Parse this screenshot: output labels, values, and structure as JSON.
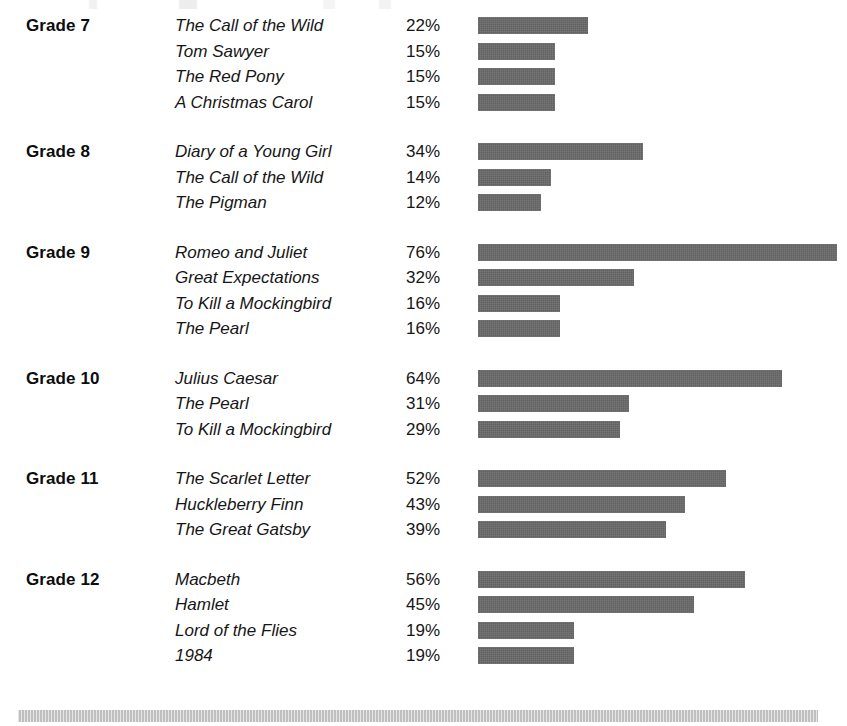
{
  "chart_data": {
    "type": "bar",
    "title": "",
    "subtitle": "",
    "xlabel": "",
    "ylabel": "",
    "orientation": "horizontal",
    "grid": false,
    "legend": null,
    "value_suffix": "%",
    "xlim": [
      0,
      80
    ],
    "bar_color": "#676767",
    "groups": [
      {
        "label": "Grade 7",
        "rows": [
          {
            "title": "The Call of the Wild",
            "value": 22,
            "value_label": "22%"
          },
          {
            "title": "Tom Sawyer",
            "value": 15,
            "value_label": "15%"
          },
          {
            "title": "The Red Pony",
            "value": 15,
            "value_label": "15%"
          },
          {
            "title": "A Christmas Carol",
            "value": 15,
            "value_label": "15%"
          }
        ]
      },
      {
        "label": "Grade 8",
        "rows": [
          {
            "title": "Diary of a Young Girl",
            "value": 34,
            "value_label": "34%"
          },
          {
            "title": "The Call of the Wild",
            "value": 14,
            "value_label": "14%"
          },
          {
            "title": "The Pigman",
            "value": 12,
            "value_label": "12%"
          }
        ]
      },
      {
        "label": "Grade 9",
        "rows": [
          {
            "title": "Romeo and Juliet",
            "value": 76,
            "value_label": "76%"
          },
          {
            "title": "Great Expectations",
            "value": 32,
            "value_label": "32%"
          },
          {
            "title": "To Kill a Mockingbird",
            "value": 16,
            "value_label": "16%"
          },
          {
            "title": "The Pearl",
            "value": 16,
            "value_label": "16%"
          }
        ]
      },
      {
        "label": "Grade 10",
        "rows": [
          {
            "title": "Julius Caesar",
            "value": 64,
            "value_label": "64%"
          },
          {
            "title": "The Pearl",
            "value": 31,
            "value_label": "31%"
          },
          {
            "title": "To Kill a Mockingbird",
            "value": 29,
            "value_label": "29%"
          }
        ]
      },
      {
        "label": "Grade 11",
        "rows": [
          {
            "title": "The Scarlet Letter",
            "value": 52,
            "value_label": "52%"
          },
          {
            "title": "Huckleberry Finn",
            "value": 43,
            "value_label": "43%"
          },
          {
            "title": "The Great Gatsby",
            "value": 39,
            "value_label": "39%"
          }
        ]
      },
      {
        "label": "Grade 12",
        "rows": [
          {
            "title": "Macbeth",
            "value": 56,
            "value_label": "56%"
          },
          {
            "title": "Hamlet",
            "value": 45,
            "value_label": "45%"
          },
          {
            "title": "Lord of the Flies",
            "value": 19,
            "value_label": "19%"
          },
          {
            "title": "1984",
            "value": 19,
            "value_label": "19%"
          }
        ]
      }
    ]
  },
  "render": {
    "px_per_percent": 4.62,
    "bar_base_offset_px": 8
  }
}
